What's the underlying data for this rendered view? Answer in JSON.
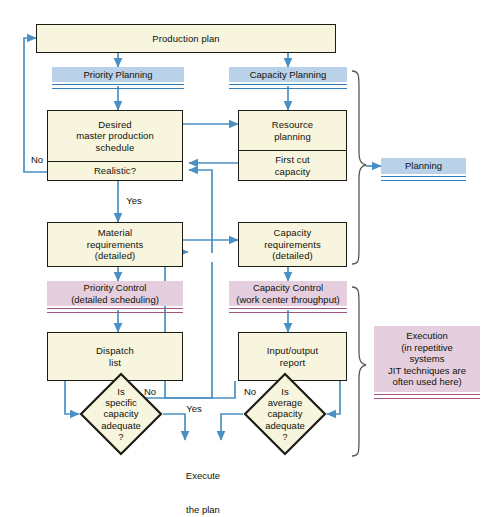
{
  "diagram": {
    "colors": {
      "box_fill": "#f7f5de",
      "box_border": "#1c1c14",
      "planning_band": "#b9d2ea",
      "planning_rule": "#2f7fc1",
      "control_band": "#e5cfdf",
      "control_rule": "#a4527f",
      "wire": "#4a90c4",
      "brace": "#5a5a52",
      "text": "#111108",
      "background": "#ffffff"
    }
  },
  "nodes": {
    "production_plan": {
      "label": "Production plan"
    },
    "mps": {
      "line1": "Desired",
      "line2": "master production",
      "line3": "schedule",
      "sub": "Realistic?"
    },
    "resource": {
      "line1": "Resource",
      "line2": "planning",
      "sub1": "First cut",
      "sub2": "capacity"
    },
    "material": {
      "line1": "Material",
      "line2": "requirements",
      "line3": "(detailed)"
    },
    "capacity_req": {
      "line1": "Capacity",
      "line2": "requirements",
      "line3": "(detailed)"
    },
    "dispatch": {
      "line1": "Dispatch",
      "line2": "list"
    },
    "io_report": {
      "line1": "Input/output",
      "line2": "report"
    }
  },
  "banners": {
    "priority_planning": {
      "label": "Priority Planning"
    },
    "capacity_planning": {
      "label": "Capacity Planning"
    },
    "planning_group": {
      "label": "Planning"
    },
    "priority_control": {
      "line1": "Priority Control",
      "line2": "(detailed scheduling)"
    },
    "capacity_control": {
      "line1": "Capacity Control",
      "line2": "(work center throughput)"
    },
    "execution_group": {
      "line1": "Execution",
      "line2": "(in repetitive",
      "line3": "systems",
      "line4": "JIT techniques are",
      "line5": "often used here)"
    }
  },
  "decisions": {
    "specific_capacity": {
      "line1": "Is",
      "line2": "specific",
      "line3": "capacity",
      "line4": "adequate",
      "line5": "?"
    },
    "average_capacity": {
      "line1": "Is",
      "line2": "average",
      "line3": "capacity",
      "line4": "adequate",
      "line5": "?"
    }
  },
  "edge_labels": {
    "mps_no": "No",
    "mps_yes": "Yes",
    "dispatch_no": "No",
    "io_no": "No",
    "specific_yes": "Yes",
    "execute_line1": "Execute",
    "execute_line2": "the plan"
  }
}
